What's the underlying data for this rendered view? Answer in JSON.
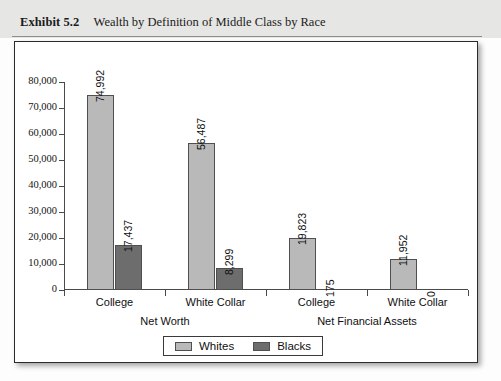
{
  "header": {
    "exhibit_label": "Exhibit 5.2",
    "caption": "Wealth by Definition of Middle Class by Race"
  },
  "legend": {
    "items": [
      {
        "label": "Whites",
        "color": "#b9b9b9"
      },
      {
        "label": "Blacks",
        "color": "#6d6d6d"
      }
    ]
  },
  "chart_data": {
    "type": "bar",
    "title": "Wealth by Definition of Middle Class by Race",
    "xlabel": "",
    "ylabel": "",
    "ylim": [
      0,
      80000
    ],
    "yticks": [
      0,
      10000,
      20000,
      30000,
      40000,
      50000,
      60000,
      70000,
      80000
    ],
    "ytick_labels": [
      "0",
      "10,000",
      "20,000",
      "30,000",
      "40,000",
      "50,000",
      "60,000",
      "70,000",
      "80,000"
    ],
    "grid": false,
    "legend_position": "bottom",
    "group_labels": [
      "Net Worth",
      "Net Financial Assets"
    ],
    "categories": [
      "College",
      "White Collar",
      "College",
      "White Collar"
    ],
    "category_groups": [
      0,
      0,
      1,
      1
    ],
    "series": [
      {
        "name": "Whites",
        "color": "#b9b9b9",
        "values": [
          74992,
          56487,
          19823,
          11952
        ],
        "value_labels": [
          "74,992",
          "56,487",
          "19,823",
          "11,952"
        ]
      },
      {
        "name": "Blacks",
        "color": "#6d6d6d",
        "values": [
          17437,
          8299,
          175,
          0
        ],
        "value_labels": [
          "17,437",
          "8,299",
          "175",
          "0"
        ]
      }
    ]
  }
}
